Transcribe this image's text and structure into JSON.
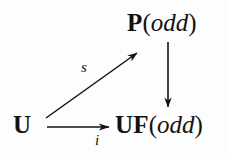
{
  "diagram": {
    "type": "commutative-diagram",
    "background_color": "#fdfdfd",
    "ink_color": "#121212",
    "nodes": [
      {
        "id": "p-odd",
        "name": "node-p-odd",
        "bold_part": "P",
        "open_paren": "(",
        "italic_part": "odd",
        "close_paren": ")",
        "position": {
          "x": 127,
          "y": 10
        }
      },
      {
        "id": "uf-odd",
        "name": "node-uf-odd",
        "bold_part": "UF",
        "open_paren": "(",
        "italic_part": "odd",
        "close_paren": ")",
        "position": {
          "x": 115,
          "y": 112
        }
      },
      {
        "id": "u",
        "name": "node-u",
        "bold_part": "U",
        "open_paren": "",
        "italic_part": "",
        "close_paren": "",
        "position": {
          "x": 13,
          "y": 112
        }
      }
    ],
    "edges": [
      {
        "id": "edge-s",
        "from": "u",
        "to": "p-odd",
        "label": "s",
        "label_position": {
          "x": 81,
          "y": 60
        },
        "direction": "diagonal-up-right",
        "start": {
          "x": 46,
          "y": 118
        },
        "end": {
          "x": 140,
          "y": 51
        }
      },
      {
        "id": "edge-i",
        "from": "u",
        "to": "uf-odd",
        "label": "i",
        "label_position": {
          "x": 95,
          "y": 133
        },
        "direction": "right",
        "start": {
          "x": 47,
          "y": 127
        },
        "end": {
          "x": 112,
          "y": 127
        }
      },
      {
        "id": "edge-vertical",
        "from": "p-odd",
        "to": "uf-odd",
        "label": "",
        "direction": "down",
        "start": {
          "x": 168,
          "y": 42
        },
        "end": {
          "x": 168,
          "y": 110
        }
      }
    ]
  }
}
